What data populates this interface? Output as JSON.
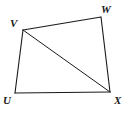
{
  "figure": {
    "kind": "geometry-diagram",
    "shape_name": "quadrilateral UVWX",
    "background_color": "#ffffff",
    "stroke_color": "#1a1a1a",
    "canvas": {
      "width": 128,
      "height": 115
    },
    "vertices": [
      {
        "id": "V",
        "label": "V",
        "x": 23,
        "y": 30,
        "label_x": 10,
        "label_y": 18
      },
      {
        "id": "W",
        "label": "W",
        "x": 101,
        "y": 17,
        "label_x": 101,
        "label_y": 4
      },
      {
        "id": "X",
        "label": "X",
        "x": 110,
        "y": 92,
        "label_x": 114,
        "label_y": 95
      },
      {
        "id": "U",
        "label": "U",
        "x": 15,
        "y": 93,
        "label_x": 3,
        "label_y": 95
      }
    ],
    "edges": [
      {
        "id": "VW",
        "from": "V",
        "to": "W",
        "path": "M 23 30 L 101 17"
      },
      {
        "id": "WX",
        "from": "W",
        "to": "X",
        "path": "M 101 17 L 110 92"
      },
      {
        "id": "XU",
        "from": "X",
        "to": "U",
        "path": "M 110 92 L 15 93"
      },
      {
        "id": "UV",
        "from": "U",
        "to": "V",
        "path": "M 15 93 L 23 30"
      }
    ],
    "diagonals": [
      {
        "id": "VX",
        "from": "V",
        "to": "X",
        "path": "M 23 30 L 110 92"
      }
    ]
  }
}
